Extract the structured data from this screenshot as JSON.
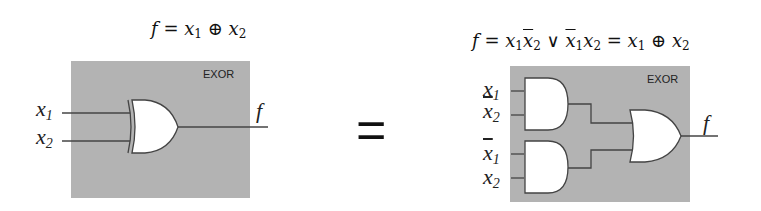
{
  "left": {
    "formula": {
      "lhs": "f",
      "eq": " = ",
      "a": "x",
      "a_sub": "1",
      "op": " ⊕ ",
      "b": "x",
      "b_sub": "2"
    },
    "box_label": "EXOR",
    "inputs": [
      {
        "var": "x",
        "sub": "1",
        "negated": false
      },
      {
        "var": "x",
        "sub": "2",
        "negated": false
      }
    ],
    "output": "f",
    "gate": "XOR"
  },
  "equals_sign": "=",
  "right": {
    "formula": {
      "lhs": "f",
      "eq1": " = ",
      "t1a": "x",
      "t1a_sub": "1",
      "t1b": "x",
      "t1b_sub": "2",
      "or": " ∨ ",
      "t2a": "x",
      "t2a_sub": "1",
      "t2b": "x",
      "t2b_sub": "2",
      "eq2": " = ",
      "r1": "x",
      "r1_sub": "1",
      "op": " ⊕ ",
      "r2": "x",
      "r2_sub": "2"
    },
    "box_label": "EXOR",
    "inputs": [
      {
        "var": "x",
        "sub": "1",
        "negated": false
      },
      {
        "var": "x",
        "sub": "2",
        "negated": true
      },
      {
        "var": "x",
        "sub": "1",
        "negated": true
      },
      {
        "var": "x",
        "sub": "2",
        "negated": false
      }
    ],
    "output": "f",
    "gates": [
      "AND",
      "AND",
      "OR"
    ]
  },
  "colors": {
    "box_fill": "#b3b3b3",
    "wire": "#444444",
    "gate_fill": "#ffffff"
  }
}
